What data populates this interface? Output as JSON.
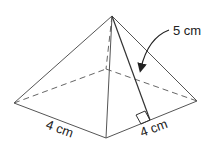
{
  "diagram": {
    "type": "square-pyramid",
    "labels": {
      "slant_height": "5 cm",
      "base_left_edge": "4 cm",
      "base_right_edge": "4 cm"
    },
    "colors": {
      "line": "#555555",
      "background": "#ffffff"
    }
  }
}
